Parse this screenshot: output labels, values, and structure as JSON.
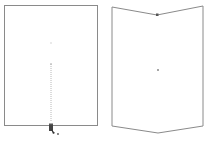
{
  "canvas": {
    "width": 209,
    "height": 142,
    "background": "#ffffff"
  },
  "left_panel": {
    "shape": "rectangle",
    "stroke_color": "#8a8a8a",
    "rect": {
      "x": 4.5,
      "y": 5.5,
      "w": 93,
      "h": 120
    },
    "center_marker": {
      "x": 51,
      "y": 43
    },
    "guide_line": {
      "x": 51,
      "y1": 64,
      "y2": 122,
      "color": "#b0b0b0"
    },
    "handle": {
      "x": 51,
      "y": 125
    },
    "cursor": {
      "x": 49,
      "y": 122,
      "label": "drag-cursor"
    }
  },
  "right_panel": {
    "shape": "chevron-polygon",
    "stroke_color": "#8a8a8a",
    "points": "112,7 157,15 203,6 203,126 158,133 112,126",
    "notch_marker": {
      "x": 157,
      "y": 15
    },
    "center_marker": {
      "x": 158,
      "y": 70
    }
  }
}
